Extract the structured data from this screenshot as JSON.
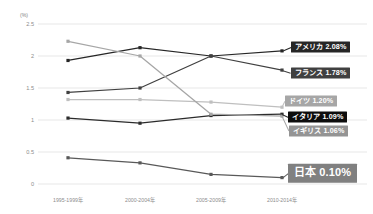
{
  "axis": {
    "unit_label": "(%)",
    "y_ticks": [
      "2.5",
      "2",
      "1.5",
      "1",
      "0.5",
      "0"
    ],
    "y_values": [
      2.5,
      2.0,
      1.5,
      1.0,
      0.5,
      0.0
    ],
    "x_ticks": [
      "1995-1999年",
      "2000-2004年",
      "2005-2009年",
      "2010-2014年"
    ]
  },
  "labels": [
    {
      "text": "アメリカ 2.08%",
      "bg": "#262626",
      "fg": "#ffffff",
      "big": false
    },
    {
      "text": "フランス 1.78%",
      "bg": "#404040",
      "fg": "#ffffff",
      "big": false
    },
    {
      "text": "ドイツ 1.20%",
      "bg": "#a6a6a6",
      "fg": "#ffffff",
      "big": false
    },
    {
      "text": "イタリア 1.09%",
      "bg": "#0d0d0d",
      "fg": "#ffffff",
      "big": false
    },
    {
      "text": "イギリス 1.06%",
      "bg": "#949494",
      "fg": "#ffffff",
      "big": false
    },
    {
      "text": "日本 0.10%",
      "bg": "#808080",
      "fg": "#ffffff",
      "big": true
    }
  ],
  "chart_data": {
    "type": "line",
    "title": "",
    "xlabel": "",
    "ylabel": "(%)",
    "ylim": [
      0,
      2.5
    ],
    "grid": true,
    "legend_position": "right-inline-labels",
    "categories": [
      "1995-1999年",
      "2000-2004年",
      "2005-2009年",
      "2010-2014年"
    ],
    "series": [
      {
        "name": "アメリカ",
        "end_label": "アメリカ 2.08%",
        "color": "#262626",
        "values": [
          1.93,
          2.13,
          2.0,
          2.08
        ]
      },
      {
        "name": "フランス",
        "end_label": "フランス 1.78%",
        "color": "#404040",
        "values": [
          1.43,
          1.5,
          2.0,
          1.78
        ]
      },
      {
        "name": "ドイツ",
        "end_label": "ドイツ 1.20%",
        "color": "#bfbfbf",
        "values": [
          1.32,
          1.32,
          1.28,
          1.2
        ]
      },
      {
        "name": "イタリア",
        "end_label": "イタリア 1.09%",
        "color": "#2b2b2b",
        "values": [
          1.03,
          0.95,
          1.07,
          1.09
        ]
      },
      {
        "name": "イギリス",
        "end_label": "イギリス 1.06%",
        "color": "#a6a6a6",
        "values": [
          2.23,
          2.0,
          1.09,
          1.06
        ]
      },
      {
        "name": "日本",
        "end_label": "日本 0.10%",
        "color": "#595959",
        "values": [
          0.41,
          0.33,
          0.15,
          0.1
        ]
      }
    ]
  }
}
